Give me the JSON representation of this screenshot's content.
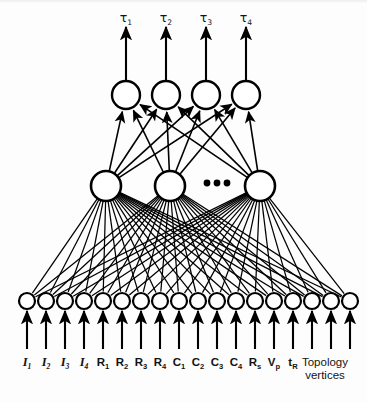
{
  "figure": {
    "background_color": "#fdfdfd",
    "stroke_color": "#000000",
    "width": 367,
    "height": 406
  },
  "output_layer": {
    "name": "output-layer",
    "node_count": 4,
    "node_radius": 14,
    "center_y": 95,
    "centers_x": [
      126,
      166,
      206,
      246
    ],
    "labels": [
      {
        "symbol": "τ",
        "subscript": "1"
      },
      {
        "symbol": "τ",
        "subscript": "2"
      },
      {
        "symbol": "τ",
        "subscript": "3"
      },
      {
        "symbol": "τ",
        "subscript": "4"
      }
    ],
    "label_y": 22,
    "arrow_top_y": 27,
    "arrow_bottom_y": 81
  },
  "hidden_layer": {
    "name": "hidden-layer",
    "visible_node_count": 3,
    "node_radius": 15,
    "center_y": 186,
    "centers_x": [
      106,
      170,
      260
    ],
    "ellipsis": {
      "label": "•••",
      "dot_count": 3,
      "dots_x": [
        207,
        217,
        227
      ],
      "dots_y": 183,
      "dot_radius": 3.4,
      "meaning": "additional hidden units"
    }
  },
  "input_layer": {
    "name": "input-layer",
    "node_count": 18,
    "node_radius": 8,
    "center_y": 301,
    "first_center_x": 27,
    "spacing_x": 19,
    "arrow_top_y": 311,
    "arrow_bottom_y": 349,
    "label_y": 366,
    "labels": [
      {
        "symbol": "I",
        "subscript": "1",
        "italic": true
      },
      {
        "symbol": "I",
        "subscript": "2",
        "italic": true
      },
      {
        "symbol": "I",
        "subscript": "3",
        "italic": true
      },
      {
        "symbol": "I",
        "subscript": "4",
        "italic": true
      },
      {
        "symbol": "R",
        "subscript": "1",
        "italic": false
      },
      {
        "symbol": "R",
        "subscript": "2",
        "italic": false
      },
      {
        "symbol": "R",
        "subscript": "3",
        "italic": false
      },
      {
        "symbol": "R",
        "subscript": "4",
        "italic": false
      },
      {
        "symbol": "C",
        "subscript": "1",
        "italic": false
      },
      {
        "symbol": "C",
        "subscript": "2",
        "italic": false
      },
      {
        "symbol": "C",
        "subscript": "3",
        "italic": false
      },
      {
        "symbol": "C",
        "subscript": "4",
        "italic": false
      },
      {
        "symbol": "R",
        "subscript": "s",
        "italic": false
      },
      {
        "symbol": "V",
        "subscript": "p",
        "italic": false
      },
      {
        "symbol": "t",
        "subscript": "R",
        "italic": false
      }
    ],
    "group_label": {
      "line1": "Topology",
      "line2": "vertices",
      "center_x": 325,
      "line1_y": 366,
      "line2_y": 379,
      "covers_node_indices": [
        15,
        16,
        17
      ]
    }
  },
  "connections": {
    "input_to_hidden": {
      "name": "input-to-hidden-edges",
      "fully_connected": true,
      "stroke_width": 1.25,
      "arrowheads": true
    },
    "hidden_to_output": {
      "name": "hidden-to-output-edges",
      "fully_connected": true,
      "stroke_width": 1.6,
      "arrowheads": true
    }
  }
}
